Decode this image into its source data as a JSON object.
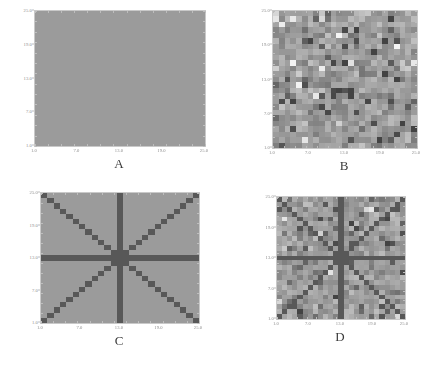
{
  "figure": {
    "background_color": "#ffffff",
    "panel_count": 4
  },
  "chart_data": [
    {
      "type": "heatmap",
      "title": "A",
      "panel_label": "A",
      "description": "Uniform constant-value grayscale density map, no structure",
      "xlabel": "",
      "ylabel": "",
      "grid": false,
      "legend": "none",
      "nrows": 25,
      "ncols": 25,
      "xlim": [
        1,
        25
      ],
      "ylim": [
        1,
        25
      ],
      "xticks": [
        1.0,
        7.0,
        13.0,
        19.0,
        25.0
      ],
      "yticks": [
        1.0,
        7.0,
        13.0,
        19.0,
        25.0
      ],
      "xtick_labels": [
        "1.0",
        "7.0",
        "13.0",
        "19.0",
        "25.0"
      ],
      "ytick_labels": [
        "1.0",
        "7.0",
        "13.0",
        "19.0",
        "25.0"
      ],
      "value_range": [
        0.5,
        0.5
      ],
      "colormap": "grayscale-inverted",
      "background_value": 0.5,
      "pattern": "uniform",
      "noise_amplitude": 0.0,
      "star_value": null
    },
    {
      "type": "heatmap",
      "title": "B",
      "panel_label": "B",
      "description": "Pure random noise grayscale density map",
      "xlabel": "",
      "ylabel": "",
      "grid": false,
      "legend": "none",
      "nrows": 25,
      "ncols": 25,
      "xlim": [
        1,
        25
      ],
      "ylim": [
        1,
        25
      ],
      "xticks": [
        1.0,
        7.0,
        13.0,
        19.0,
        25.0
      ],
      "yticks": [
        1.0,
        7.0,
        13.0,
        19.0,
        25.0
      ],
      "xtick_labels": [
        "1.0",
        "7.0",
        "13.0",
        "19.0",
        "25.0"
      ],
      "ytick_labels": [
        "1.0",
        "7.0",
        "13.0",
        "19.0",
        "25.0"
      ],
      "value_range": [
        0.0,
        1.0
      ],
      "colormap": "grayscale-inverted",
      "background_value": 0.5,
      "pattern": "noise",
      "noise_amplitude": 1.0,
      "star_value": null
    },
    {
      "type": "heatmap",
      "title": "C",
      "panel_label": "C",
      "description": "Eight-spoke star pattern: horizontal, vertical and two diagonal lines crossing at center",
      "xlabel": "",
      "ylabel": "",
      "grid": false,
      "legend": "none",
      "nrows": 25,
      "ncols": 25,
      "xlim": [
        1,
        25
      ],
      "ylim": [
        1,
        25
      ],
      "xticks": [
        1.0,
        7.0,
        13.0,
        19.0,
        25.0
      ],
      "yticks": [
        1.0,
        7.0,
        13.0,
        19.0,
        25.0
      ],
      "xtick_labels": [
        "1.0",
        "7.0",
        "13.0",
        "19.0",
        "25.0"
      ],
      "ytick_labels": [
        "1.0",
        "7.0",
        "13.0",
        "19.0",
        "25.0"
      ],
      "value_range": [
        0.5,
        0.9
      ],
      "colormap": "grayscale-inverted",
      "background_value": 0.5,
      "pattern": "star",
      "noise_amplitude": 0.0,
      "star_value": 0.88,
      "star_center": [
        13,
        13
      ]
    },
    {
      "type": "heatmap",
      "title": "D",
      "panel_label": "D",
      "description": "Eight-spoke star pattern superimposed on random noise",
      "xlabel": "",
      "ylabel": "",
      "grid": false,
      "legend": "none",
      "nrows": 25,
      "ncols": 25,
      "xlim": [
        1,
        25
      ],
      "ylim": [
        1,
        25
      ],
      "xticks": [
        1.0,
        7.0,
        13.0,
        19.0,
        25.0
      ],
      "yticks": [
        1.0,
        7.0,
        13.0,
        19.0,
        25.0
      ],
      "xtick_labels": [
        "1.0",
        "7.0",
        "13.0",
        "19.0",
        "25.0"
      ],
      "ytick_labels": [
        "1.0",
        "7.0",
        "13.0",
        "19.0",
        "25.0"
      ],
      "value_range": [
        0.0,
        1.0
      ],
      "colormap": "grayscale-inverted",
      "background_value": 0.5,
      "pattern": "star+noise",
      "noise_amplitude": 0.85,
      "star_value": 0.88,
      "star_center": [
        13,
        13
      ]
    }
  ],
  "panels": {
    "A": {
      "letter": "A",
      "plot_width": 170,
      "plot_height": 135,
      "seed": 11
    },
    "B": {
      "letter": "B",
      "plot_width": 144,
      "plot_height": 137,
      "seed": 23
    },
    "C": {
      "letter": "C",
      "plot_width": 158,
      "plot_height": 130,
      "seed": 37
    },
    "D": {
      "letter": "D",
      "plot_width": 128,
      "plot_height": 122,
      "seed": 59
    }
  },
  "colors": {
    "page_background": "#ffffff",
    "panel_background": "#d2d2d2",
    "frame_border": "#c9c9c9",
    "tick_color": "#bdbdbd",
    "tick_label_color": "#8d8d8d",
    "letter_color": "#3a3a3a",
    "star_color": "#585858",
    "noise_light": "#f2f2f2",
    "noise_dark": "#4a4a4a"
  }
}
